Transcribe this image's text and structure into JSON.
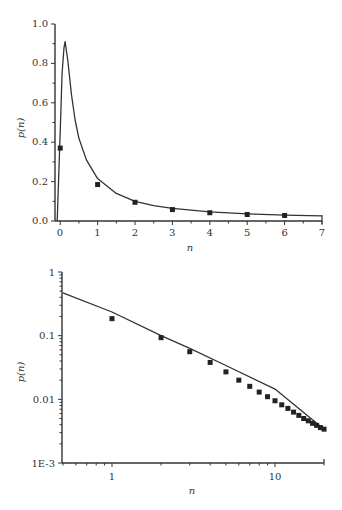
{
  "chart_data": [
    {
      "type": "line",
      "scale": "linear",
      "title": "",
      "xlabel": "n",
      "ylabel": "p(n)",
      "xlim": [
        -0.14,
        7
      ],
      "ylim": [
        0,
        1.0
      ],
      "xticks": [
        "0",
        "1",
        "2",
        "3",
        "4",
        "5",
        "6",
        "7"
      ],
      "yticks": [
        "0.0",
        "0.2",
        "0.4",
        "0.6",
        "0.8",
        "1.0"
      ],
      "grid": false,
      "series": [
        {
          "name": "fit curve",
          "kind": "line",
          "x": [
            -0.08,
            0.0,
            0.05,
            0.1,
            0.13,
            0.2,
            0.3,
            0.4,
            0.5,
            0.7,
            1.0,
            1.5,
            2.0,
            2.5,
            3.0,
            4.0,
            5.0,
            6.0,
            7.0
          ],
          "y": [
            0.0,
            0.45,
            0.75,
            0.88,
            0.91,
            0.82,
            0.64,
            0.51,
            0.42,
            0.31,
            0.215,
            0.14,
            0.1,
            0.078,
            0.064,
            0.046,
            0.036,
            0.03,
            0.026
          ]
        },
        {
          "name": "data points",
          "kind": "scatter",
          "x": [
            0,
            1,
            2,
            3,
            4,
            5,
            6
          ],
          "y": [
            0.37,
            0.185,
            0.095,
            0.058,
            0.042,
            0.033,
            0.028
          ]
        }
      ]
    },
    {
      "type": "line",
      "scale": "log-log",
      "title": "",
      "xlabel": "n",
      "ylabel": "p(n)",
      "xlim": [
        0.5,
        20
      ],
      "ylim": [
        0.001,
        1
      ],
      "xticks": [
        "1",
        "10"
      ],
      "yticks": [
        "1E-3",
        "0.01",
        "0.1",
        "1"
      ],
      "grid": false,
      "series": [
        {
          "name": "fit curve",
          "kind": "line",
          "x": [
            0.5,
            1,
            2,
            3,
            5,
            10,
            20
          ],
          "y": [
            0.47,
            0.235,
            0.1,
            0.063,
            0.034,
            0.0145,
            0.0034
          ]
        },
        {
          "name": "data points",
          "kind": "scatter",
          "x": [
            1,
            2,
            3,
            4,
            5,
            6,
            7,
            8,
            9,
            10,
            11,
            12,
            13,
            14,
            15,
            16,
            17,
            18,
            19,
            20
          ],
          "y": [
            0.185,
            0.093,
            0.056,
            0.038,
            0.027,
            0.02,
            0.016,
            0.013,
            0.011,
            0.0095,
            0.0082,
            0.0072,
            0.0063,
            0.0056,
            0.005,
            0.0046,
            0.0042,
            0.0039,
            0.0036,
            0.0034
          ]
        }
      ]
    }
  ],
  "top_chart": {
    "xlabel": "n",
    "ylabel": "p(n)",
    "xticks": [
      "0",
      "1",
      "2",
      "3",
      "4",
      "5",
      "6",
      "7"
    ],
    "yticks": [
      "0.0",
      "0.2",
      "0.4",
      "0.6",
      "0.8",
      "1.0"
    ]
  },
  "bottom_chart": {
    "xlabel": "n",
    "ylabel": "p(n)",
    "xticks": [
      "1",
      "10"
    ],
    "yticks": [
      "1E-3",
      "0.01",
      "0.1",
      "1"
    ]
  },
  "colors": {
    "line": "#333333",
    "marker": "#222222",
    "axis": "#333333"
  }
}
